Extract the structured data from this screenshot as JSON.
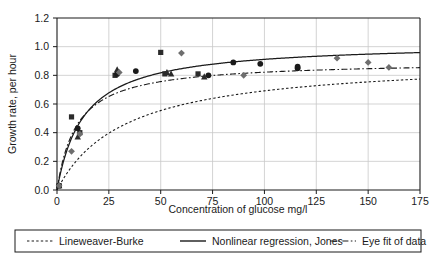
{
  "chart_data": {
    "type": "scatter",
    "title": "",
    "subtitle": "",
    "xlabel": "Concentration of glucose mg/l",
    "ylabel": "Growth rate, per hour",
    "xlim": [
      0,
      175
    ],
    "ylim": [
      0.0,
      1.2
    ],
    "xticks": [
      "0",
      "25",
      "50",
      "75",
      "100",
      "125",
      "150",
      "175"
    ],
    "xtick_values": [
      0,
      25,
      50,
      75,
      100,
      125,
      150,
      175
    ],
    "yticks": [
      "0.0",
      "0.2",
      "0.4",
      "0.6",
      "0.8",
      "1.0",
      "1.2"
    ],
    "ytick_values": [
      0.0,
      0.2,
      0.4,
      0.6,
      0.8,
      1.0,
      1.2
    ],
    "grid": true,
    "grid_axis": "both",
    "legend_position": "below-outside",
    "points": {
      "squares": {
        "marker": "square",
        "color": "#2b2b2b",
        "x": [
          1,
          7,
          11,
          28,
          50,
          52,
          68
        ],
        "y": [
          0.03,
          0.51,
          0.4,
          0.8,
          0.96,
          0.81,
          0.81
        ]
      },
      "circles": {
        "marker": "circle",
        "color": "#1a1a1a",
        "x": [
          1,
          10,
          29,
          38,
          73,
          85,
          98,
          116,
          116
        ],
        "y": [
          0.03,
          0.43,
          0.81,
          0.83,
          0.8,
          0.89,
          0.88,
          0.85,
          0.86
        ]
      },
      "triangles": {
        "marker": "triangle",
        "color": "#2b2b2b",
        "x": [
          1,
          10,
          29,
          53,
          55,
          71
        ],
        "y": [
          0.03,
          0.37,
          0.84,
          0.82,
          0.81,
          0.79
        ]
      },
      "diamonds": {
        "marker": "diamond",
        "color": "#6e6e6e",
        "x": [
          1,
          7,
          11,
          30,
          60,
          90,
          135,
          150,
          160
        ],
        "y": [
          0.03,
          0.27,
          0.39,
          0.82,
          0.955,
          0.8,
          0.92,
          0.89,
          0.855
        ]
      }
    },
    "curves": [
      {
        "name": "Lineweaver-Burke",
        "style": "dotted",
        "color": "#1a1a1a",
        "model": "michaelis-menten",
        "vmax": 0.92,
        "km": 33.0
      },
      {
        "name": "Nonlinear regression, Jones",
        "style": "solid",
        "color": "#1a1a1a",
        "model": "michaelis-menten",
        "vmax": 1.03,
        "km": 13.0
      },
      {
        "name": "Eye fit of data",
        "style": "dashed",
        "color": "#1a1a1a",
        "model": "michaelis-menten",
        "vmax": 0.9,
        "km": 9.5
      }
    ]
  },
  "legend": {
    "items": [
      {
        "label": "Lineweaver-Burke",
        "style": "dotted"
      },
      {
        "label": "Nonlinear regression, Jones",
        "style": "solid"
      },
      {
        "label": "Eye fit of data",
        "style": "dashed"
      }
    ]
  },
  "colors": {
    "axis": "#1a1a1a",
    "grid": "#c8c8c8",
    "plot_background": "#ffffff",
    "marker_dark": "#1a1a1a",
    "marker_gray": "#6e6e6e"
  }
}
